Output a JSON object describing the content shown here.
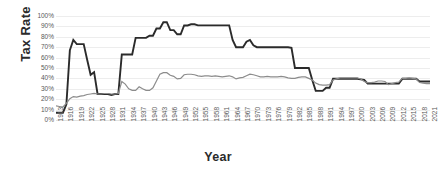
{
  "chart_data": {
    "type": "line",
    "title": "",
    "xlabel": "Year",
    "ylabel": "Tax Rate",
    "xlim": [
      1913,
      2021
    ],
    "ylim": [
      0,
      1.0
    ],
    "grid": true,
    "legend": "none",
    "ytick_labels": [
      "100%",
      "90%",
      "80%",
      "70%",
      "60%",
      "50%",
      "40%",
      "30%",
      "20%",
      "10%",
      "0%"
    ],
    "ytick_values": [
      1.0,
      0.9,
      0.8,
      0.7,
      0.6,
      0.5,
      0.4,
      0.3,
      0.2,
      0.1,
      0.0
    ],
    "xtick_labels": [
      "1913",
      "1916",
      "1919",
      "1922",
      "1925",
      "1928",
      "1931",
      "1934",
      "1937",
      "1940",
      "1943",
      "1946",
      "1949",
      "1952",
      "1955",
      "1958",
      "1961",
      "1964",
      "1967",
      "1970",
      "1973",
      "1976",
      "1979",
      "1982",
      "1985",
      "1988",
      "1991",
      "1994",
      "1997",
      "2000",
      "2003",
      "2006",
      "2009",
      "2012",
      "2015",
      "2018",
      "2021"
    ],
    "x": [
      1913,
      1914,
      1915,
      1916,
      1917,
      1918,
      1919,
      1920,
      1921,
      1922,
      1923,
      1924,
      1925,
      1926,
      1927,
      1928,
      1929,
      1930,
      1931,
      1932,
      1933,
      1934,
      1935,
      1936,
      1937,
      1938,
      1939,
      1940,
      1941,
      1942,
      1943,
      1944,
      1945,
      1946,
      1947,
      1948,
      1949,
      1950,
      1951,
      1952,
      1953,
      1954,
      1955,
      1956,
      1957,
      1958,
      1959,
      1960,
      1961,
      1962,
      1963,
      1964,
      1965,
      1966,
      1967,
      1968,
      1969,
      1970,
      1971,
      1972,
      1973,
      1974,
      1975,
      1976,
      1977,
      1978,
      1979,
      1980,
      1981,
      1982,
      1983,
      1984,
      1985,
      1986,
      1987,
      1988,
      1989,
      1990,
      1991,
      1992,
      1993,
      1994,
      1995,
      1996,
      1997,
      1998,
      1999,
      2000,
      2001,
      2002,
      2003,
      2004,
      2005,
      2006,
      2007,
      2008,
      2009,
      2010,
      2011,
      2012,
      2013,
      2014,
      2015,
      2016,
      2017,
      2018,
      2019,
      2020,
      2021
    ],
    "series": [
      {
        "name": "Top marginal tax rate",
        "color": "#2b2b2b",
        "width": 1.9,
        "values": [
          0.07,
          0.07,
          0.07,
          0.15,
          0.67,
          0.77,
          0.73,
          0.73,
          0.73,
          0.58,
          0.435,
          0.46,
          0.25,
          0.25,
          0.25,
          0.25,
          0.24,
          0.25,
          0.25,
          0.63,
          0.63,
          0.63,
          0.63,
          0.79,
          0.79,
          0.79,
          0.79,
          0.8115,
          0.81,
          0.88,
          0.88,
          0.94,
          0.94,
          0.8645,
          0.8645,
          0.8245,
          0.8245,
          0.91,
          0.909,
          0.92,
          0.92,
          0.91,
          0.91,
          0.91,
          0.91,
          0.91,
          0.91,
          0.91,
          0.91,
          0.91,
          0.91,
          0.77,
          0.7,
          0.7,
          0.7,
          0.7525,
          0.77,
          0.7175,
          0.7,
          0.7,
          0.7,
          0.7,
          0.7,
          0.7,
          0.7,
          0.7,
          0.7,
          0.7,
          0.695,
          0.5,
          0.5,
          0.5,
          0.5,
          0.5,
          0.385,
          0.28,
          0.28,
          0.28,
          0.31,
          0.31,
          0.396,
          0.396,
          0.396,
          0.396,
          0.396,
          0.396,
          0.396,
          0.396,
          0.391,
          0.386,
          0.35,
          0.35,
          0.35,
          0.35,
          0.35,
          0.35,
          0.35,
          0.35,
          0.35,
          0.35,
          0.396,
          0.396,
          0.396,
          0.396,
          0.396,
          0.37,
          0.37,
          0.37,
          0.37
        ]
      },
      {
        "name": "Effective / average tax rate",
        "color": "#8c8c8c",
        "width": 1.2,
        "values": [
          0.135,
          0.13,
          0.125,
          0.16,
          0.205,
          0.225,
          0.22,
          0.23,
          0.235,
          0.245,
          0.25,
          0.255,
          0.25,
          0.25,
          0.255,
          0.255,
          0.25,
          0.25,
          0.255,
          0.37,
          0.345,
          0.3,
          0.285,
          0.285,
          0.32,
          0.3,
          0.285,
          0.285,
          0.31,
          0.375,
          0.44,
          0.455,
          0.455,
          0.43,
          0.42,
          0.395,
          0.4,
          0.435,
          0.44,
          0.44,
          0.435,
          0.425,
          0.42,
          0.425,
          0.425,
          0.42,
          0.425,
          0.42,
          0.415,
          0.42,
          0.425,
          0.415,
          0.395,
          0.405,
          0.41,
          0.425,
          0.44,
          0.435,
          0.425,
          0.415,
          0.415,
          0.42,
          0.415,
          0.415,
          0.415,
          0.42,
          0.415,
          0.405,
          0.4,
          0.4,
          0.41,
          0.415,
          0.415,
          0.4,
          0.385,
          0.355,
          0.34,
          0.335,
          0.335,
          0.34,
          0.385,
          0.395,
          0.405,
          0.405,
          0.405,
          0.405,
          0.405,
          0.405,
          0.395,
          0.37,
          0.36,
          0.36,
          0.365,
          0.375,
          0.375,
          0.37,
          0.34,
          0.35,
          0.36,
          0.365,
          0.4,
          0.4,
          0.405,
          0.4,
          0.395,
          0.36,
          0.355,
          0.35,
          0.35
        ]
      }
    ]
  }
}
